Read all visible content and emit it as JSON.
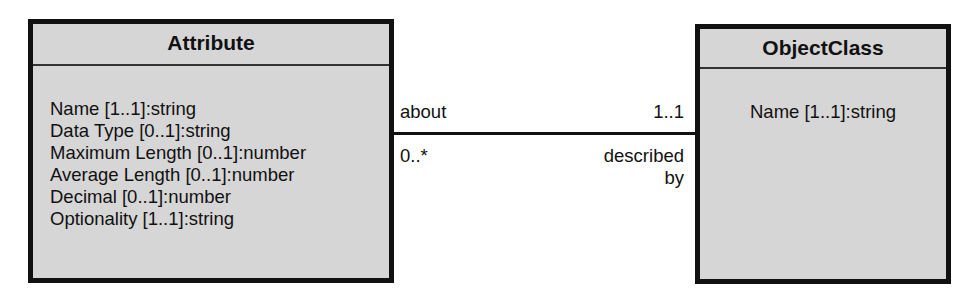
{
  "diagram": {
    "type": "UML class diagram",
    "classes": [
      {
        "name": "Attribute",
        "attributes": [
          "Name [1..1]:string",
          "Data Type [0..1]:string",
          "Maximum Length [0..1]:number",
          "Average Length [0..1]:number",
          "Decimal [0..1]:number",
          "Optionality [1..1]:string"
        ]
      },
      {
        "name": "ObjectClass",
        "attributes": [
          "Name [1..1]:string"
        ]
      }
    ],
    "association": {
      "from": "Attribute",
      "to": "ObjectClass",
      "role_near_attribute": "about",
      "multiplicity_near_attribute": "0..*",
      "multiplicity_near_objectclass": "1..1",
      "role_near_objectclass_line1": "described",
      "role_near_objectclass_line2": "by"
    },
    "colors": {
      "box_fill": "#d6d6d6",
      "border": "#111111",
      "background": "#ffffff"
    }
  }
}
